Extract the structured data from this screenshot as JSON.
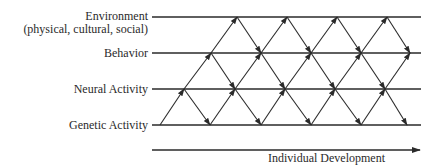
{
  "levels": [
    {
      "label": "Environment",
      "sublabel": "(physical, cultural, social)"
    },
    {
      "label": "Behavior"
    },
    {
      "label": "Neural Activity"
    },
    {
      "label": "Genetic Activity"
    }
  ],
  "axis": {
    "label": "Individual Development"
  },
  "colors": {
    "line": "#2a2a2a",
    "background": "#ffffff"
  }
}
